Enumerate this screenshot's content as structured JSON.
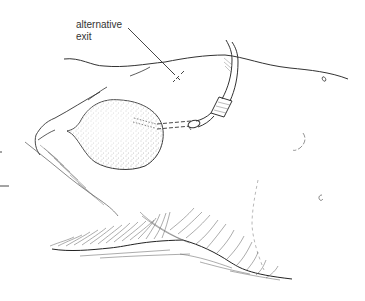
{
  "figure": {
    "type": "surgical illustration",
    "annotations": [
      {
        "line1": "alternative",
        "line2": "exit",
        "target": "cross-mark"
      }
    ]
  },
  "colors": {
    "ink": "#333333",
    "background": "#ffffff",
    "stipple": "#555555"
  },
  "icons": {
    "exit-mark": "dashed-cross",
    "catheter": "tube-with-connector",
    "reservoir": "stippled-balloon"
  }
}
